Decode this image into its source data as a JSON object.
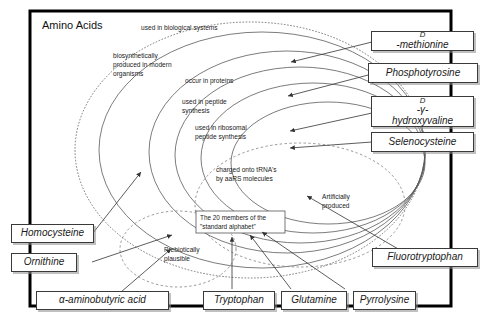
{
  "diagram": {
    "title": "Amino Acids",
    "frame": {
      "border_color": "#000000"
    }
  },
  "rings": [
    {
      "id": "used-in-biological-systems",
      "label": "used in biological systems",
      "style": "dotted"
    },
    {
      "id": "biosynthetically-produced",
      "label": "biosynthetically produced in modern organisms",
      "style": "solid",
      "lines": [
        "biosynthetically",
        "produced in modern",
        "organisms"
      ]
    },
    {
      "id": "occur-in-proteins",
      "label": "occur in proteins",
      "style": "solid",
      "lines": [
        "occur in proteins"
      ]
    },
    {
      "id": "used-in-peptide-synthesis",
      "label": "used in peptide synthesis",
      "style": "solid",
      "lines": [
        "used in peptide",
        "synthesis"
      ]
    },
    {
      "id": "used-in-ribosomal-peptide-synthesis",
      "label": "used in ribosomal peptide synthesis",
      "style": "solid",
      "lines": [
        "used in ribosomal",
        "peptide synthesis"
      ]
    },
    {
      "id": "charged-onto-trna",
      "label": "charged onto tRNA's by aaRS molecules",
      "style": "solid",
      "lines": [
        "charged onto tRNA's",
        "by aaRS molecules"
      ]
    }
  ],
  "dashed_regions": [
    {
      "id": "artificially-produced",
      "label": "Artificially produced",
      "lines": [
        "Artificially",
        "produced"
      ]
    },
    {
      "id": "prebiotically-plausible",
      "label": "Prebiotically plausible",
      "lines": [
        "Prebiotically",
        "plausible"
      ]
    }
  ],
  "core": {
    "id": "standard-alphabet",
    "label": "The 20 members of the \"standard alphabet\"",
    "lines": [
      "The 20 members of the",
      "\"standard alphabet\""
    ]
  },
  "labels": {
    "right": [
      {
        "id": "d-methionine",
        "text": "D-methionine",
        "smallcap_prefix": "D",
        "rest": "-methionine"
      },
      {
        "id": "phosphotyrosine",
        "text": "Phosphotyrosine"
      },
      {
        "id": "d-gamma-hydroxyvaline",
        "text": "D-γ-hydroxyvaline",
        "line1_prefix": "D",
        "line1_rest": "-γ-",
        "line2": "hydroxyvaline"
      },
      {
        "id": "selenocysteine",
        "text": "Selenocysteine"
      },
      {
        "id": "fluorotryptophan",
        "text": "Fluorotryptophan"
      }
    ],
    "left": [
      {
        "id": "homocysteine",
        "text": "Homocysteine"
      },
      {
        "id": "ornithine",
        "text": "Ornithine"
      }
    ],
    "bottom": [
      {
        "id": "alpha-aminobutyric-acid",
        "text": "α-aminobutyric acid"
      },
      {
        "id": "tryptophan",
        "text": "Tryptophan"
      },
      {
        "id": "glutamine",
        "text": "Glutamine"
      },
      {
        "id": "pyrrolysine",
        "text": "Pyrrolysine"
      }
    ]
  }
}
